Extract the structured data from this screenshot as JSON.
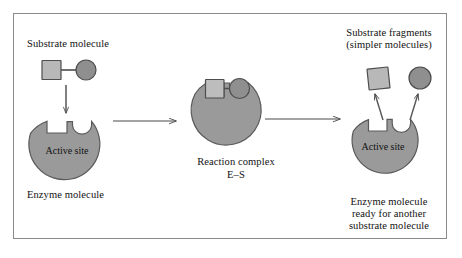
{
  "figure": {
    "title_absent": true,
    "background_color": "#ffffff",
    "frame_color": "#8a8a8a",
    "enzyme_fill": "#9a9a9a",
    "enzyme_stroke": "#5a5a5a",
    "substrate_square_fill": "#b8b8b8",
    "substrate_square_stroke": "#4d4d4d",
    "substrate_circle_fill": "#8f8f8f",
    "substrate_circle_stroke": "#4d4d4d",
    "arrow_color": "#4a4a4a"
  },
  "labels": {
    "substrate_molecule": "Substrate molecule",
    "enzyme_molecule": "Enzyme molecule",
    "active_site_left": "Active site",
    "active_site_right": "Active site",
    "reaction_complex_line1": "Reaction complex",
    "reaction_complex_line2": "E–S",
    "substrate_fragments_line1": "Substrate fragments",
    "substrate_fragments_line2": "(simpler molecules)",
    "enzyme_ready_line1": "Enzyme molecule",
    "enzyme_ready_line2": "ready for another",
    "enzyme_ready_line3": "substrate molecule"
  },
  "stages": [
    {
      "id": "stage-1",
      "name": "free-enzyme-and-substrate",
      "enzyme_label": "Enzyme molecule",
      "site_label": "Active site",
      "substrate_label": "Substrate molecule"
    },
    {
      "id": "stage-2",
      "name": "enzyme-substrate-complex",
      "complex_label": "Reaction complex",
      "complex_formula": "E–S"
    },
    {
      "id": "stage-3",
      "name": "products-released",
      "products_label": "Substrate fragments",
      "products_sublabel": "(simpler molecules)",
      "enzyme_label": "Enzyme molecule ready for another substrate molecule",
      "site_label": "Active site"
    }
  ],
  "arrows": [
    {
      "name": "substrate-binding-arrow",
      "direction": "down"
    },
    {
      "name": "reaction-arrow-1",
      "direction": "right"
    },
    {
      "name": "reaction-arrow-2",
      "direction": "right"
    },
    {
      "name": "product-release-arrow-square",
      "direction": "up-left"
    },
    {
      "name": "product-release-arrow-circle",
      "direction": "up-right"
    }
  ]
}
